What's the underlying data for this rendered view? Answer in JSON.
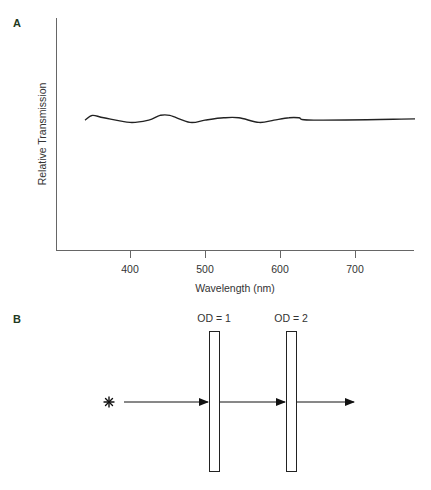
{
  "panels": {
    "a": {
      "label": "A"
    },
    "b": {
      "label": "B"
    }
  },
  "chart_data": {
    "type": "line",
    "title": "",
    "xlabel": "Wavelength (nm)",
    "ylabel": "Relative Transmission",
    "x_ticks": [
      400,
      500,
      600,
      700
    ],
    "x_tick_labels": [
      "400",
      "500",
      "600",
      "700"
    ],
    "xlim": [
      300,
      780
    ],
    "ylim": [
      0,
      1
    ],
    "y_ticks": [],
    "grid": false,
    "legend": null,
    "series": [
      {
        "name": "Relative Transmission",
        "x": [
          340,
          350,
          365,
          400,
          425,
          440,
          453,
          480,
          500,
          525,
          545,
          572,
          592,
          612,
          625,
          645,
          780
        ],
        "y": [
          0.56,
          0.58,
          0.57,
          0.55,
          0.56,
          0.58,
          0.58,
          0.55,
          0.56,
          0.57,
          0.57,
          0.55,
          0.56,
          0.57,
          0.57,
          0.56,
          0.565
        ]
      }
    ]
  },
  "diagram": {
    "filters": [
      {
        "label": "OD = 1"
      },
      {
        "label": "OD = 2"
      }
    ],
    "source_symbol": "✱"
  }
}
